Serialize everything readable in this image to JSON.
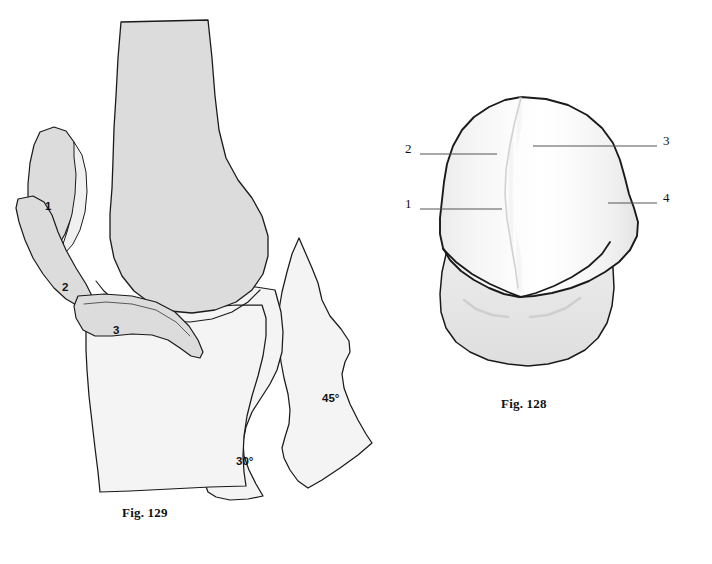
{
  "plate": {
    "background_color": "#ffffff",
    "outline_color": "#1a1a1a",
    "figures": [
      {
        "id": "fig-129",
        "caption": "Fig. 129",
        "title": "Fig. 129",
        "view": "lateral knee, sagittal, patellar tracking at progressive flexion",
        "caption_x": 122,
        "caption_y": 505
      },
      {
        "id": "fig-128",
        "caption": "Fig. 128",
        "title": "Fig. 128",
        "view": "distal femur, anterior view of trochlea and condyles",
        "caption_x": 501,
        "caption_y": 396
      }
    ]
  },
  "fig129": {
    "caption": "Fig. 129",
    "bone_fill_light": "#f2f2f2",
    "bone_fill_mid": "#dcdcdc",
    "stroke": "#1a1a1a",
    "patella_positions": [
      {
        "label": "1",
        "x": 49,
        "y": 207,
        "flexion": "0°"
      },
      {
        "label": "2",
        "x": 66,
        "y": 288,
        "flexion": "30°"
      },
      {
        "label": "3",
        "x": 117,
        "y": 331,
        "flexion": "45°"
      }
    ],
    "angle_labels": [
      {
        "label": "30°",
        "x": 243,
        "y": 462
      },
      {
        "label": "45°",
        "x": 328,
        "y": 399
      }
    ]
  },
  "fig128": {
    "caption": "Fig. 128",
    "bone_fill_light": "#fafafa",
    "bone_fill_shadow": "#e8e8e8",
    "stroke": "#1a1a1a",
    "leader_color": "#555555",
    "callouts": [
      {
        "label": "1",
        "x": 409,
        "y": 203,
        "side": "left",
        "leader_from_x": 420,
        "leader_to_x": 502,
        "leader_y": 209
      },
      {
        "label": "2",
        "x": 409,
        "y": 148,
        "side": "left",
        "leader_from_x": 420,
        "leader_to_x": 497,
        "leader_y": 154
      },
      {
        "label": "3",
        "x": 665,
        "y": 140,
        "side": "right",
        "leader_from_x": 657,
        "leader_to_x": 533,
        "leader_y": 146
      },
      {
        "label": "4",
        "x": 665,
        "y": 197,
        "side": "right",
        "leader_from_x": 657,
        "leader_to_x": 608,
        "leader_y": 203
      }
    ]
  }
}
